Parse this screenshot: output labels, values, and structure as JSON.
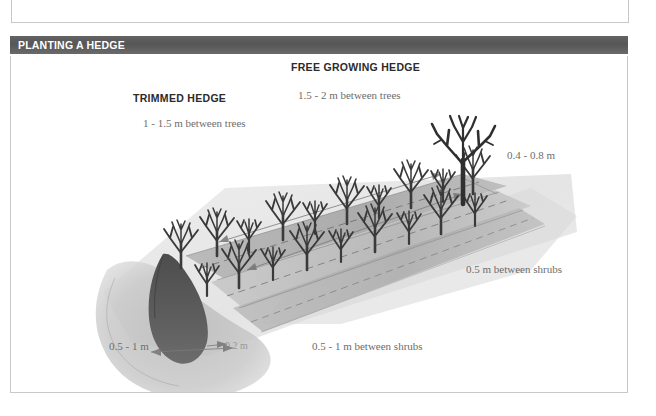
{
  "section": {
    "title": "PLANTING A HEDGE"
  },
  "figure": {
    "alt_name": "hedge-planting-perspective-illustration",
    "labels": {
      "trimmed_hedge": "TRIMMED HEDGE",
      "trimmed_hedge_spacing": "1 - 1.5 m between trees",
      "free_growing_hedge": "FREE GROWING HEDGE",
      "free_growing_hedge_spacing": "1.5 - 2 m between trees",
      "row_gap": "0.4 - 0.8 m",
      "shrub_spacing_right": "0.5 m between shrubs",
      "trench_width": "0.5 - 1 m",
      "trench_depth": "0.2 m",
      "shrub_spacing_bottom": "0.5 - 1 m between shrubs"
    }
  },
  "colors": {
    "section_bar": "#595959",
    "section_title_text": "#ffffff",
    "box_border": "#c9c9c9",
    "heading_text": "#2b2b2b",
    "dimension_text": "#6d6d6d",
    "plant_dark": "#3a3a3a",
    "bed_mid": "#a9a9a9",
    "bed_light": "#cfcfcf",
    "soil_mound": "#bdbdbd",
    "trench_dark": "#585858",
    "page_background": "#ffffff"
  }
}
